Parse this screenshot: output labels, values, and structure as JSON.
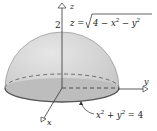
{
  "diagram": {
    "type": "3d-surface",
    "axes": {
      "x": "x",
      "y": "y",
      "z": "z"
    },
    "z_tick": "2",
    "surface_equation": "z = √(4 − x² − y²)",
    "surface_equation_parts": {
      "lhs": "z = ",
      "radical": "4 − x",
      "sup1": "2",
      "mid": " − y",
      "sup2": "2"
    },
    "boundary_equation_parts": {
      "a": "x",
      "sup1": "2",
      "b": " + y",
      "sup2": "2",
      "c": " = 4"
    },
    "boundary_equation": "x² + y² = 4",
    "colors": {
      "surface": "#d4d4d4",
      "base": "#c8c8c8",
      "outline": "#555555",
      "axis": "#333333"
    }
  }
}
